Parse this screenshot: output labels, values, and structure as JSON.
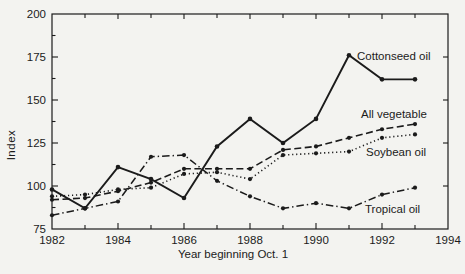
{
  "figure": {
    "background": "#f3f3f0",
    "ink_color": "#1b1b1b"
  },
  "chart_data": {
    "type": "line",
    "title": "",
    "xlabel": "Year beginning Oct. 1",
    "ylabel": "Index",
    "xlim": [
      1982,
      1994
    ],
    "ylim": [
      75,
      200
    ],
    "x_major_tick_step": 2,
    "x_minor_tick_step": 1,
    "y_major_tick_step": 25,
    "y_minor_tick_step": 12.5,
    "x_tick_labels": [
      "1982",
      "1984",
      "1986",
      "1988",
      "1990",
      "1992",
      "1994"
    ],
    "y_tick_labels": [
      "75",
      "100",
      "125",
      "150",
      "175",
      "200"
    ],
    "grid": false,
    "legend_position": "inline-labels",
    "x": [
      1982,
      1983,
      1984,
      1985,
      1986,
      1987,
      1988,
      1989,
      1990,
      1991,
      1992,
      1993
    ],
    "series": [
      {
        "name": "Tropical oil",
        "style": "dashdot",
        "values": [
          83,
          87,
          91,
          117,
          118,
          103,
          94,
          87,
          90,
          87,
          95,
          99
        ]
      },
      {
        "name": "Soybean oil",
        "style": "dotted",
        "values": [
          94,
          95,
          98,
          99,
          107,
          108,
          104,
          118,
          119,
          120,
          128,
          130
        ]
      },
      {
        "name": "All vegetable",
        "style": "dashed",
        "values": [
          92,
          93,
          97,
          102,
          110,
          110,
          110,
          121,
          123,
          128,
          133,
          136
        ]
      },
      {
        "name": "Cottonseed oil",
        "style": "solid",
        "values": [
          98,
          87,
          111,
          104,
          93,
          123,
          139,
          125,
          139,
          176,
          162,
          162
        ]
      }
    ]
  }
}
